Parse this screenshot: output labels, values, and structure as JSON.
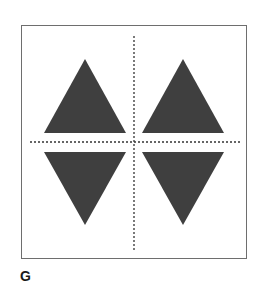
{
  "figure": {
    "label": "G",
    "colors": {
      "triangle_fill": "#3f3f3f",
      "axis": "#333333",
      "border": "#6e6e6e"
    },
    "shapes": [
      {
        "name": "triangle-upper-left",
        "orientation": "up"
      },
      {
        "name": "triangle-upper-right",
        "orientation": "up"
      },
      {
        "name": "triangle-lower-left",
        "orientation": "down"
      },
      {
        "name": "triangle-lower-right",
        "orientation": "down"
      }
    ],
    "axes": [
      {
        "name": "horizontal-axis",
        "style": "dotted"
      },
      {
        "name": "vertical-axis",
        "style": "dotted"
      }
    ]
  }
}
